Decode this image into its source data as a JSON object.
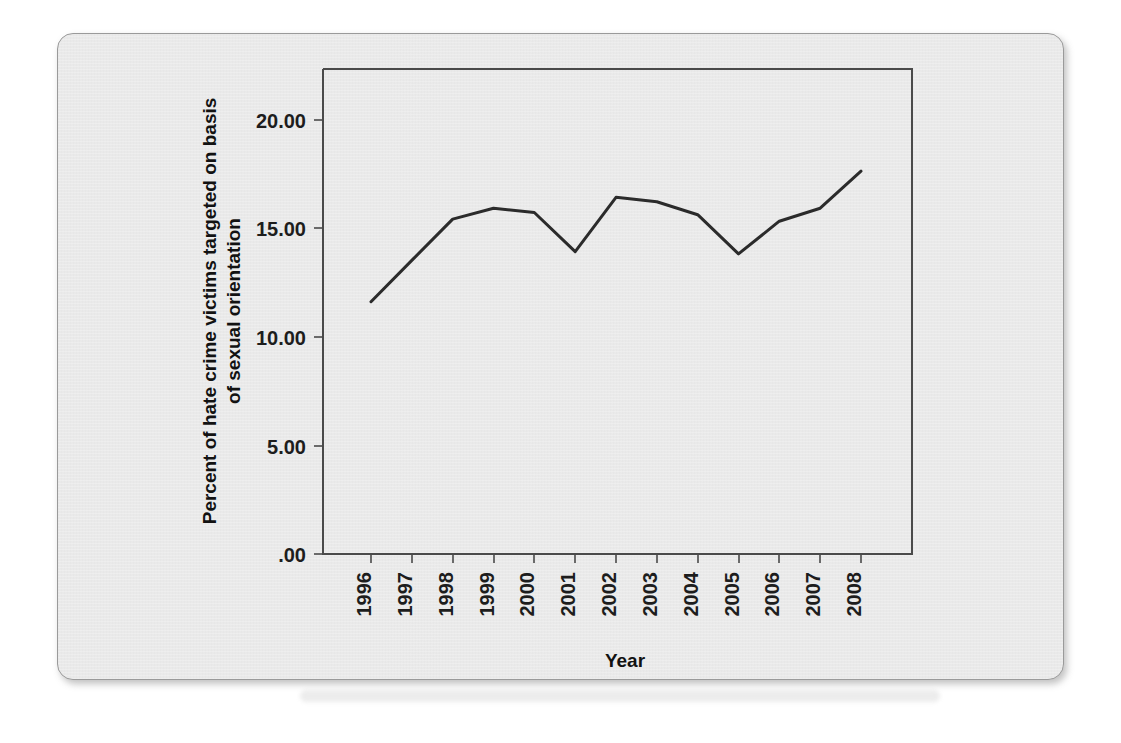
{
  "chart_data": {
    "type": "line",
    "title": "",
    "xlabel": "Year",
    "ylabel": "Percent of hate crime victims targeted on basis of sexual orientation",
    "ylabel_lines": [
      "Percent of hate crime victims targeted on basis",
      "of sexual orientation"
    ],
    "categories": [
      "1996",
      "1997",
      "1998",
      "1999",
      "2000",
      "2001",
      "2002",
      "2003",
      "2004",
      "2005",
      "2006",
      "2007",
      "2008"
    ],
    "x": [
      1996,
      1997,
      1998,
      1999,
      2000,
      2001,
      2002,
      2003,
      2004,
      2005,
      2006,
      2007,
      2008
    ],
    "values": [
      11.6,
      13.5,
      15.4,
      15.9,
      15.7,
      13.9,
      16.4,
      16.2,
      15.6,
      13.8,
      15.3,
      15.9,
      17.6
    ],
    "series": [
      {
        "name": "Percent of hate crime victims targeted on basis of sexual orientation",
        "values": [
          11.6,
          13.5,
          15.4,
          15.9,
          15.7,
          13.9,
          16.4,
          16.2,
          15.6,
          13.8,
          15.3,
          15.9,
          17.6
        ]
      }
    ],
    "ylim": [
      0,
      22.3
    ],
    "xlim": [
      1996,
      2008
    ],
    "y_tick_values": [
      0,
      5,
      10,
      15,
      20
    ],
    "y_tick_labels": [
      ".00",
      "5.00",
      "10.00",
      "15.00",
      "20.00"
    ],
    "x_tick_labels": [
      "1996",
      "1997",
      "1998",
      "1999",
      "2000",
      "2001",
      "2002",
      "2003",
      "2004",
      "2005",
      "2006",
      "2007",
      "2008"
    ],
    "x_tick_rotation": -90,
    "grid": false,
    "legend": false,
    "legend_position": "none",
    "line_color": "#2b2b2b",
    "axis_color": "#4a4a4a",
    "background_color": "#e9e9e9"
  }
}
